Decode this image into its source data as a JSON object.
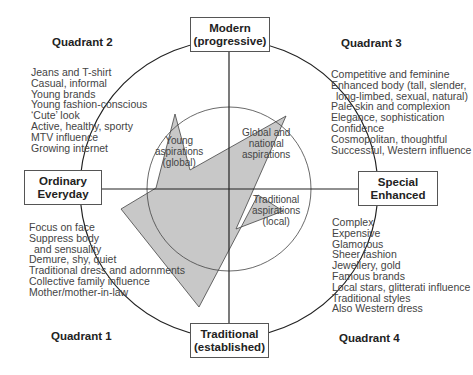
{
  "axes": {
    "top": {
      "line1": "Modern",
      "line2": "(progressive)"
    },
    "bottom": {
      "line1": "Traditional",
      "line2": "(established)"
    },
    "left": {
      "line1": "Ordinary",
      "line2": "Everyday"
    },
    "right": {
      "line1": "Special",
      "line2": "Enhanced"
    }
  },
  "quadrants": {
    "q1": {
      "title": "Quadrant 1",
      "items": [
        "Focus on face",
        "Suppress body",
        "and sensuality",
        "Demure, shy, quiet",
        "Traditional dress and adornments",
        "Collective family influence",
        "Mother/mother-in-law"
      ]
    },
    "q2": {
      "title": "Quadrant 2",
      "items": [
        "Jeans and T-shirt",
        "Casual, informal",
        "Young brands",
        "Young fashion-conscious",
        "‘Cute’ look",
        "Active, healthy, sporty",
        "MTV influence",
        "Growing internet"
      ]
    },
    "q3": {
      "title": "Quadrant 3",
      "items": [
        "Competitive and feminine",
        "Enhanced body (tall, slender,",
        "long-limbed, sexual, natural)",
        "Pale skin and complexion",
        "Elegance, sophistication",
        "Confidence",
        "Cosmopolitan, thoughtful",
        "Successful, Western influence"
      ]
    },
    "q4": {
      "title": "Quadrant 4",
      "items": [
        "Complex",
        "Expensive",
        "Glamorous",
        "Sheer fashion",
        "Jewellery, gold",
        "Famous brands",
        "Local stars, glitterati influence",
        "Traditional styles",
        "Also Western dress"
      ]
    }
  },
  "aspirations": {
    "young": {
      "line1": "Young",
      "line2": "aspirations",
      "line3": "(global)"
    },
    "global": {
      "line1": "Global and",
      "line2": "national",
      "line3": "aspirations"
    },
    "traditional": {
      "line1": "Traditional",
      "line2": "aspirations",
      "line3": "(local)"
    }
  },
  "colors": {
    "polygon_fill": "#c8c8c8",
    "line": "#222222",
    "box_border": "#555555"
  }
}
